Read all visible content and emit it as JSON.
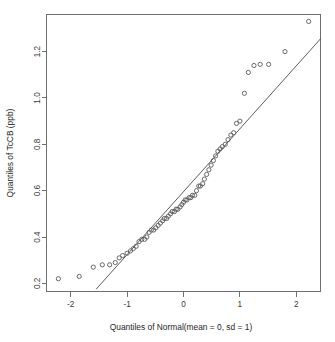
{
  "chart_data": {
    "type": "scatter",
    "title": "",
    "subtitle": "",
    "xlabel": "Quantiles of Normal(mean = 0, sd = 1)",
    "ylabel": "Quantiles of TcCB (ppb)",
    "xlim": [
      -2.43,
      2.43
    ],
    "ylim": [
      0.165,
      1.36
    ],
    "xticks": [
      -2,
      -1,
      0,
      1,
      2
    ],
    "xtick_labels": [
      "-2",
      "-1",
      "0",
      "1",
      "2"
    ],
    "yticks": [
      0.2,
      0.4,
      0.6,
      0.8,
      1.0,
      1.2
    ],
    "ytick_labels": [
      "0.2",
      "0.4",
      "0.6",
      "0.8",
      "1.0",
      "1.2"
    ],
    "grid": false,
    "legend": null,
    "point_marker": "open-circle",
    "point_color": "#595959",
    "line_color": "#4a4a4a",
    "box_color": "#6f6f6f",
    "reference_line": {
      "label": "qq reference line",
      "x_start": -1.55,
      "y_start": 0.175,
      "x_end": 2.43,
      "y_end": 1.255
    },
    "series": [
      {
        "name": "TcCB sample quantiles",
        "x": [
          -2.22,
          -1.85,
          -1.6,
          -1.44,
          -1.31,
          -1.21,
          -1.14,
          -1.08,
          -1.0,
          -0.94,
          -0.89,
          -0.84,
          -0.79,
          -0.74,
          -0.69,
          -0.65,
          -0.61,
          -0.57,
          -0.53,
          -0.49,
          -0.45,
          -0.41,
          -0.37,
          -0.34,
          -0.3,
          -0.27,
          -0.23,
          -0.2,
          -0.16,
          -0.13,
          -0.1,
          -0.06,
          -0.03,
          0.0,
          0.03,
          0.06,
          0.1,
          0.13,
          0.16,
          0.2,
          0.23,
          0.27,
          0.3,
          0.34,
          0.37,
          0.41,
          0.45,
          0.49,
          0.53,
          0.57,
          0.61,
          0.65,
          0.69,
          0.74,
          0.79,
          0.84,
          0.89,
          0.94,
          1.0,
          1.08,
          1.15,
          1.25,
          1.36,
          1.51,
          1.8,
          2.22
        ],
        "y": [
          0.22,
          0.23,
          0.27,
          0.28,
          0.28,
          0.29,
          0.31,
          0.32,
          0.33,
          0.34,
          0.35,
          0.36,
          0.38,
          0.39,
          0.39,
          0.4,
          0.42,
          0.43,
          0.43,
          0.44,
          0.45,
          0.46,
          0.47,
          0.48,
          0.48,
          0.49,
          0.5,
          0.51,
          0.51,
          0.52,
          0.52,
          0.53,
          0.54,
          0.55,
          0.56,
          0.56,
          0.57,
          0.57,
          0.58,
          0.58,
          0.6,
          0.62,
          0.62,
          0.63,
          0.65,
          0.67,
          0.69,
          0.71,
          0.73,
          0.75,
          0.77,
          0.78,
          0.79,
          0.8,
          0.82,
          0.84,
          0.85,
          0.89,
          0.9,
          1.02,
          1.11,
          1.14,
          1.145,
          1.145,
          1.2,
          1.33
        ]
      }
    ]
  },
  "axes": {
    "x_title": "Quantiles of Normal(mean = 0, sd = 1)",
    "y_title": "Quantiles of TcCB (ppb)"
  }
}
